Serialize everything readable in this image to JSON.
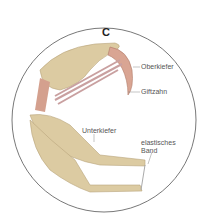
{
  "title": "C",
  "labels": {
    "oberkiefer": "Oberkiefer",
    "giftzahn": "Giftzahn",
    "unterkiefer": "Unterkiefer",
    "elastisches_line1": "elastisches",
    "elastisches_line2": "Band"
  },
  "colors": {
    "bone": "#dcc9a0",
    "bone_dark": "#b9a47a",
    "fang": "#d9a08f",
    "circle": "#444444"
  }
}
